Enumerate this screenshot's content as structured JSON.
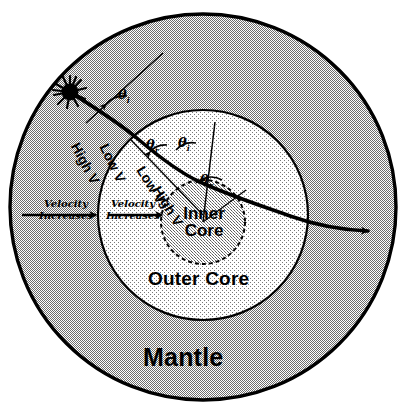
{
  "diagram": {
    "layers": [
      {
        "name": "mantle",
        "label": "Mantle"
      },
      {
        "name": "outer-core",
        "label": "Outer Core"
      },
      {
        "name": "inner-core",
        "label_line1": "Inner",
        "label_line2": "Core"
      }
    ],
    "velocity_arrows": [
      {
        "name": "mantle-velocity-arrow",
        "line1": "Velocity",
        "line2": "Increases"
      },
      {
        "name": "outer-core-velocity-arrow",
        "line1": "Velocity",
        "line2": "Increases"
      }
    ],
    "velocity_labels": [
      {
        "name": "mantle-high-v",
        "text": "High V"
      },
      {
        "name": "outer-core-low-v",
        "text": "Low V"
      },
      {
        "name": "outer-core-low-v-2",
        "text": "Low V"
      },
      {
        "name": "inner-core-high-v",
        "text": "High V"
      }
    ],
    "angle_labels": [
      {
        "name": "incident-angle-1",
        "symbol": "θ",
        "sub": "i"
      },
      {
        "name": "refracted-angle-1",
        "symbol": "θ",
        "sub": "r"
      },
      {
        "name": "incident-angle-2",
        "symbol": "θ",
        "sub": "i"
      },
      {
        "name": "refracted-angle-2",
        "symbol": "θ",
        "sub": "r"
      }
    ],
    "source": {
      "name": "earthquake-source",
      "symbol": "starburst"
    },
    "colors": {
      "mantle_fill": "#bfbfbf",
      "outer_core_fill": "#e8e8e8",
      "inner_core_fill": "#c9c9c9",
      "stroke": "#000000",
      "background": "#ffffff"
    }
  }
}
